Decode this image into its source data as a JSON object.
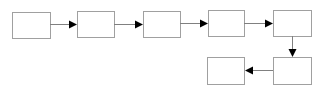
{
  "diagram": {
    "type": "flowchart",
    "stroke_color": "#a0a0a0",
    "arrow_color": "#000000",
    "line_color": "#808080",
    "nodes": [
      {
        "id": "box-1",
        "label": "",
        "x": 12,
        "y": 12,
        "w": 38,
        "h": 26
      },
      {
        "id": "box-2",
        "label": "",
        "x": 77,
        "y": 11,
        "w": 37,
        "h": 26
      },
      {
        "id": "box-3",
        "label": "",
        "x": 143,
        "y": 11,
        "w": 37,
        "h": 26
      },
      {
        "id": "box-4",
        "label": "",
        "x": 208,
        "y": 10,
        "w": 36,
        "h": 26
      },
      {
        "id": "box-5",
        "label": "",
        "x": 273,
        "y": 10,
        "w": 38,
        "h": 26
      },
      {
        "id": "box-6",
        "label": "",
        "x": 273,
        "y": 57,
        "w": 38,
        "h": 27
      },
      {
        "id": "box-7",
        "label": "",
        "x": 207,
        "y": 57,
        "w": 37,
        "h": 27
      }
    ],
    "edges": [
      {
        "from": "box-1",
        "to": "box-2",
        "direction": "right"
      },
      {
        "from": "box-2",
        "to": "box-3",
        "direction": "right"
      },
      {
        "from": "box-3",
        "to": "box-4",
        "direction": "right"
      },
      {
        "from": "box-4",
        "to": "box-5",
        "direction": "right"
      },
      {
        "from": "box-5",
        "to": "box-6",
        "direction": "down"
      },
      {
        "from": "box-6",
        "to": "box-7",
        "direction": "left"
      }
    ]
  }
}
